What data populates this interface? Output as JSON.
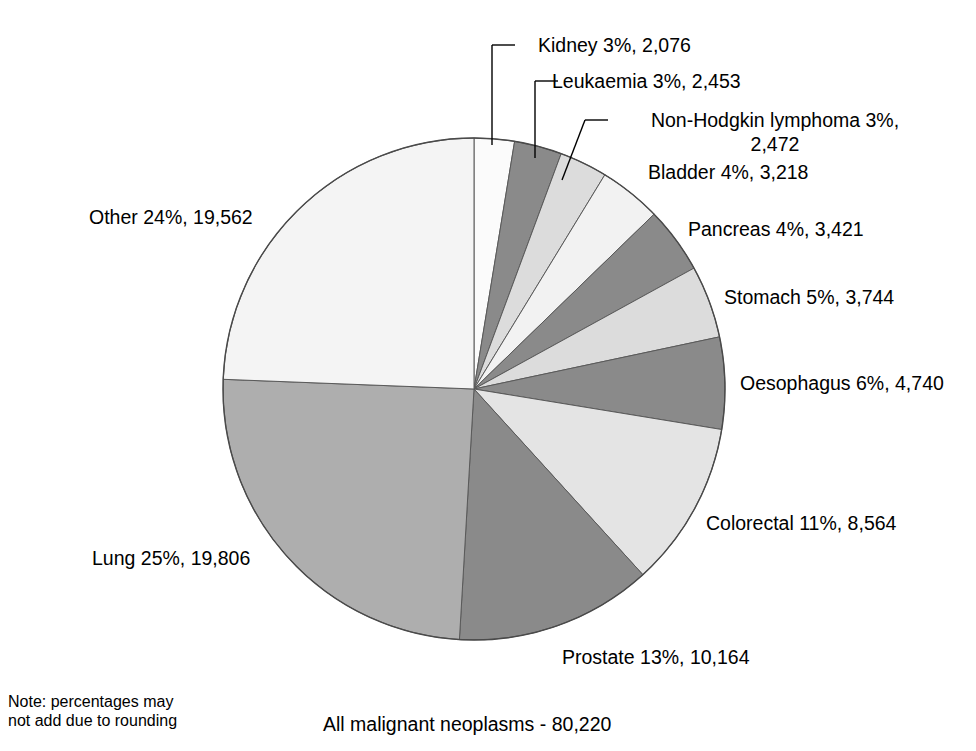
{
  "chart_data": {
    "type": "pie",
    "title": "All malignant neoplasms - 80,220",
    "total": 80220,
    "total_label": "80,220",
    "start_angle_deg": 0,
    "direction": "clockwise",
    "center": {
      "x": 474,
      "y": 389
    },
    "radius": 251,
    "note": "Note: percentages may\nnot add due to rounding",
    "categories": [
      "Kidney",
      "Leukaemia",
      "Non-Hodgkin lymphoma",
      "Bladder",
      "Pancreas",
      "Stomach",
      "Oesophagus",
      "Colorectal",
      "Prostate",
      "Lung",
      "Other"
    ],
    "values": [
      2076,
      2453,
      2472,
      3218,
      3421,
      3744,
      4740,
      8564,
      10164,
      19806,
      19562
    ],
    "percents": [
      3,
      3,
      3,
      4,
      4,
      5,
      6,
      11,
      13,
      25,
      24
    ],
    "slices": [
      {
        "name": "Kidney",
        "label": "Kidney 3%, 2,076",
        "percent": 3,
        "value": 2076,
        "value_label": "2,076",
        "color": "#fbfbfb"
      },
      {
        "name": "Leukaemia",
        "label": "Leukaemia 3%, 2,453",
        "percent": 3,
        "value": 2453,
        "value_label": "2,453",
        "color": "#8a8a8a"
      },
      {
        "name": "Non-Hodgkin lymphoma",
        "label": "Non-Hodgkin lymphoma 3%, 2,472",
        "percent": 3,
        "value": 2472,
        "value_label": "2,472",
        "color": "#dcdcdc"
      },
      {
        "name": "Bladder",
        "label": "Bladder 4%, 3,218",
        "percent": 4,
        "value": 3218,
        "value_label": "3,218",
        "color": "#f2f2f2"
      },
      {
        "name": "Pancreas",
        "label": "Pancreas 4%, 3,421",
        "percent": 4,
        "value": 3421,
        "value_label": "3,421",
        "color": "#8a8a8a"
      },
      {
        "name": "Stomach",
        "label": "Stomach 5%, 3,744",
        "percent": 5,
        "value": 3744,
        "value_label": "3,744",
        "color": "#dcdcdc"
      },
      {
        "name": "Oesophagus",
        "label": "Oesophagus 6%, 4,740",
        "percent": 6,
        "value": 4740,
        "value_label": "4,740",
        "color": "#8a8a8a"
      },
      {
        "name": "Colorectal",
        "label": "Colorectal 11%, 8,564",
        "percent": 11,
        "value": 8564,
        "value_label": "8,564",
        "color": "#e4e4e4"
      },
      {
        "name": "Prostate",
        "label": "Prostate 13%, 10,164",
        "percent": 13,
        "value": 10164,
        "value_label": "10,164",
        "color": "#8a8a8a"
      },
      {
        "name": "Lung",
        "label": "Lung 25%, 19,806",
        "percent": 25,
        "value": 19806,
        "value_label": "19,806",
        "color": "#aeaeae"
      },
      {
        "name": "Other",
        "label": "Other 24%, 19,562",
        "percent": 24,
        "value": 19562,
        "value_label": "19,562",
        "color": "#f4f4f4"
      }
    ],
    "legend_position": "callout-labels",
    "grid": false
  },
  "labels": {
    "kidney": "Kidney 3%, 2,076",
    "leukaemia": "Leukaemia 3%, 2,453",
    "non_hodgkin_line1": "Non-Hodgkin lymphoma 3%,",
    "non_hodgkin_line2": "2,472",
    "bladder": "Bladder 4%, 3,218",
    "pancreas": "Pancreas 4%, 3,421",
    "stomach": "Stomach 5%, 3,744",
    "oesophagus": "Oesophagus 6%, 4,740",
    "colorectal": "Colorectal 11%, 8,564",
    "prostate": "Prostate 13%, 10,164",
    "lung": "Lung 25%, 19,806",
    "other": "Other 24%, 19,562"
  },
  "footer": {
    "note": "Note: percentages may\nnot add due to rounding",
    "title": "All malignant neoplasms - 80,220"
  }
}
